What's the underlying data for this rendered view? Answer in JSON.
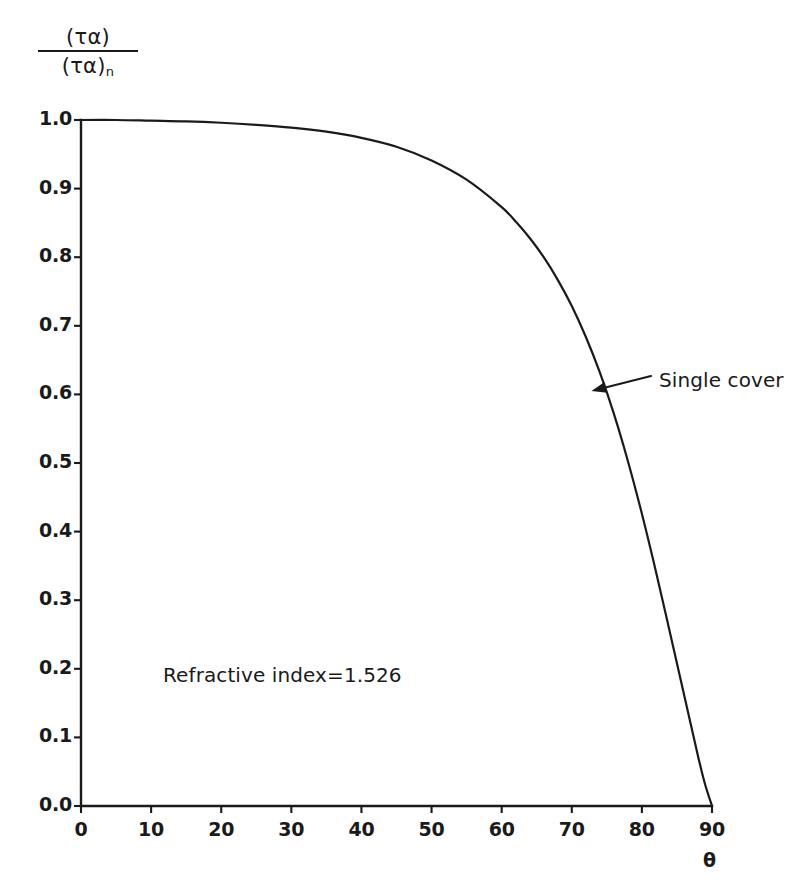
{
  "chart_data": {
    "type": "line",
    "title": "",
    "subtitle": "",
    "xlabel": "θ",
    "ylabel_numerator": "(τα)",
    "ylabel_denominator": "(τα)",
    "ylabel_denominator_sub": "n",
    "ylabel": "(τα)/(τα)n",
    "xlim": [
      0,
      90
    ],
    "ylim": [
      0.0,
      1.0
    ],
    "xticks": [
      0,
      10,
      20,
      30,
      40,
      50,
      60,
      70,
      80,
      90
    ],
    "xtick_labels": [
      "0",
      "10",
      "20",
      "30",
      "40",
      "50",
      "60",
      "70",
      "80",
      "90"
    ],
    "yticks": [
      0.0,
      0.1,
      0.2,
      0.3,
      0.4,
      0.5,
      0.6,
      0.7,
      0.8,
      0.9,
      1.0
    ],
    "ytick_labels": [
      "0.0",
      "0.1",
      "0.2",
      "0.3",
      "0.4",
      "0.5",
      "0.6",
      "0.7",
      "0.8",
      "0.9",
      "1.0"
    ],
    "grid": false,
    "legend": "none",
    "line_color": "#1a1a1a",
    "background_color": "#ffffff",
    "series": [
      {
        "name": "Single cover",
        "x": [
          0,
          5,
          10,
          15,
          20,
          25,
          30,
          35,
          40,
          45,
          50,
          55,
          60,
          62,
          64,
          66,
          68,
          70,
          72,
          74,
          76,
          78,
          80,
          82,
          84,
          86,
          88,
          89,
          90
        ],
        "values": [
          1.0,
          1.0,
          0.999,
          0.998,
          0.996,
          0.993,
          0.989,
          0.983,
          0.974,
          0.961,
          0.941,
          0.913,
          0.873,
          0.852,
          0.828,
          0.8,
          0.767,
          0.729,
          0.684,
          0.632,
          0.572,
          0.503,
          0.426,
          0.342,
          0.253,
          0.163,
          0.073,
          0.032,
          0.0
        ]
      }
    ],
    "annotations": [
      {
        "name": "series-label",
        "text": "Single cover",
        "point_x": 72.8,
        "point_y": 0.605,
        "has_arrow": true
      },
      {
        "name": "note",
        "text": "Refractive index=1.526",
        "point_x": 12,
        "point_y": 0.21,
        "has_arrow": false
      }
    ]
  }
}
